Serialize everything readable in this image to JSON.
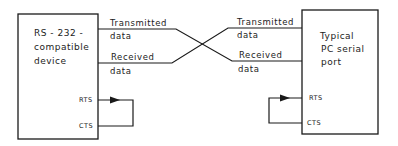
{
  "diagram": {
    "left_device": {
      "label_lines": [
        "RS - 232 -",
        "compatible",
        "device"
      ],
      "pins": {
        "rts": "RTS",
        "cts": "CTS"
      }
    },
    "right_device": {
      "label_lines": [
        "Typical",
        "PC serial",
        "port"
      ],
      "pins": {
        "rts": "RTS",
        "cts": "CTS"
      }
    },
    "signals": {
      "left": {
        "transmitted": [
          "Transmitted",
          "data"
        ],
        "received": [
          "Received",
          "data"
        ]
      },
      "right": {
        "transmitted": [
          "Transmitted",
          "data"
        ],
        "received": [
          "Received",
          "data"
        ]
      }
    },
    "colors": {
      "line": "#1a1a1a",
      "background": "#ffffff"
    }
  }
}
